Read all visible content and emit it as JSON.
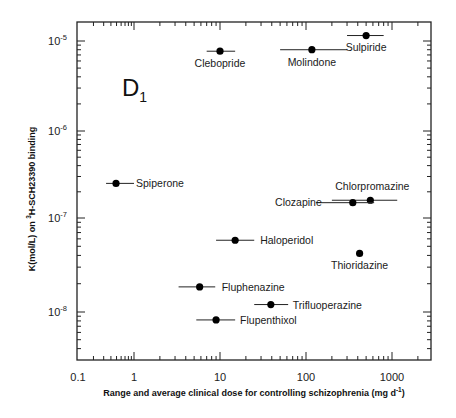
{
  "chart_data": {
    "type": "scatter",
    "title": "",
    "panel_label": "D",
    "panel_subscript": "1",
    "xlabel": "Range and average clinical dose for controlling schizophrenia (mg d",
    "xlabel_sup": "-1",
    "xlabel_end": ")",
    "ylabel_pre": "K(mol/L) on ",
    "ylabel_sup": "3",
    "ylabel_post": "H-SCH23390 binding",
    "xscale": "log",
    "yscale": "log",
    "xlim": [
      0.1,
      3000
    ],
    "ylim": [
      3.5e-09,
      1.5e-05
    ],
    "x_ticks": [
      "0.1",
      "1",
      "10",
      "100",
      "1000"
    ],
    "y_ticks": [
      {
        "base": "10",
        "exp": "-5"
      },
      {
        "base": "10",
        "exp": "-6"
      },
      {
        "base": "10",
        "exp": "-7"
      },
      {
        "base": "10",
        "exp": "-8"
      }
    ],
    "grid": false,
    "legend": null,
    "points": [
      {
        "name": "Clebopride",
        "x": 10,
        "x_range": [
          7,
          15
        ],
        "y": 7.7e-06
      },
      {
        "name": "Molindone",
        "x": 117,
        "x_range": [
          50,
          300
        ],
        "y": 8e-06
      },
      {
        "name": "Sulpiride",
        "x": 500,
        "x_range": [
          300,
          800
        ],
        "y": 1.15e-05
      },
      {
        "name": "Spiperone",
        "x": 0.49,
        "x_range": [
          0.33,
          1.0
        ],
        "y": 2.5e-07
      },
      {
        "name": "Chlorpromazine",
        "x": 560,
        "x_range": [
          200,
          1150
        ],
        "y": 1.6e-07
      },
      {
        "name": "Clozapine",
        "x": 350,
        "x_range": [
          130,
          620
        ],
        "y": 1.5e-07
      },
      {
        "name": "Haloperidol",
        "x": 15,
        "x_range": [
          9,
          25
        ],
        "y": 5.8e-08
      },
      {
        "name": "Thioridazine",
        "x": 420,
        "x_range": null,
        "y": 4.2e-08
      },
      {
        "name": "Fluphenazine",
        "x": 5.8,
        "x_range": [
          3.3,
          8.8
        ],
        "y": 1.85e-08
      },
      {
        "name": "Trifluoperazine",
        "x": 39,
        "x_range": [
          25,
          62
        ],
        "y": 1.2e-08
      },
      {
        "name": "Flupenthixol",
        "x": 9,
        "x_range": [
          5.3,
          15
        ],
        "y": 8.2e-09
      }
    ]
  }
}
